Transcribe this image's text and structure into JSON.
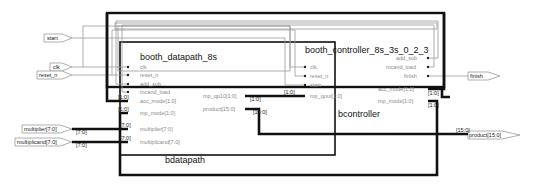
{
  "inputs": {
    "start": "start",
    "clk": "clk",
    "reset_n": "reset_n",
    "multiplier": "multiplier[7:0]",
    "multiplicand": "multiplicand[7:0]"
  },
  "outputs": {
    "finish": "finish",
    "product": "product[15:0]"
  },
  "datapath": {
    "module": "booth_datapath_8s",
    "instance": "bdatapath",
    "ports_in": [
      "clk",
      "reset_n",
      "add_sub",
      "mcand_load",
      "acc_mode[1:0]",
      "mp_mode[1:0]",
      "multiplier[7:0]",
      "multiplicand[7:0]"
    ],
    "ports_out": [
      "mp_qp10[1:0]",
      "product[15:0]"
    ]
  },
  "controller": {
    "module": "booth_controller_8s_3s_0_2_3",
    "instance": "bcontroller",
    "ports_in": [
      "clk",
      "reset_n",
      "start",
      "mp_qout[1:0]"
    ],
    "ports_out": [
      "add_sub",
      "mcand_load",
      "finish",
      "acc_mode[1:0]",
      "mp_mode[1:0]"
    ]
  },
  "bus_labels": {
    "acc_mode": "[1:0]",
    "mp_mode": "[1:0]",
    "multiplier_in": "[7:0]",
    "multiplier_src": "[7:0]",
    "multiplicand_in": "[7:0]",
    "multiplicand_src": "[7:0]",
    "mp_qp10_src": "[1:0]",
    "mp_qout_in": "[1:0]",
    "product_src": "[15:0]",
    "product_out": "[15:0]",
    "ctrl_acc_mode": "[1:0]",
    "ctrl_mp_mode": "[1:0]"
  }
}
